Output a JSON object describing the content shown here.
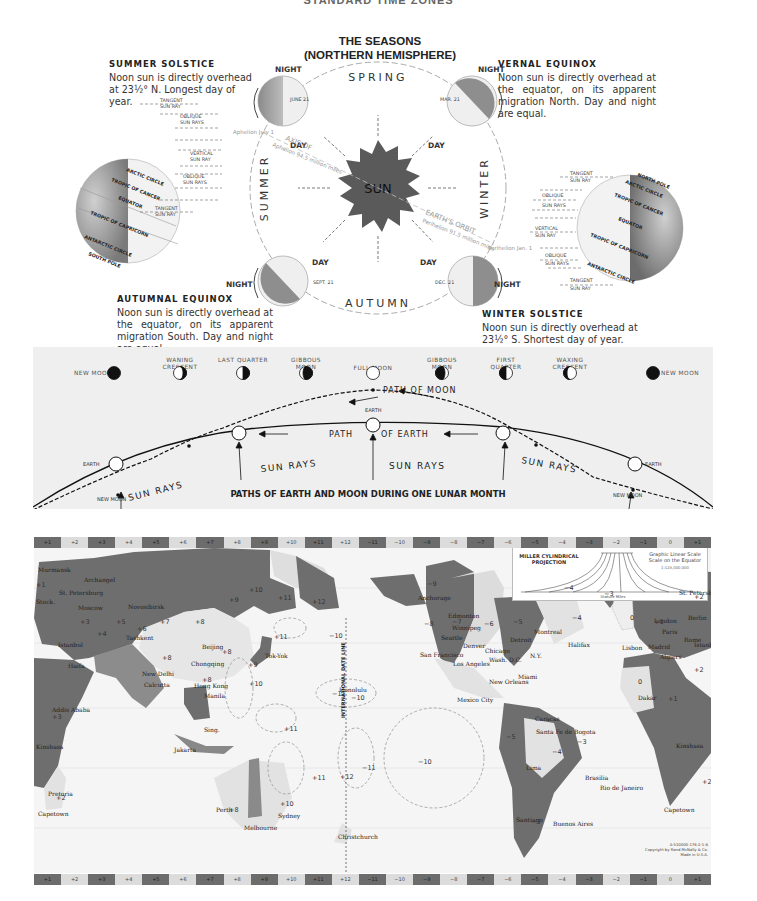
{
  "page": {
    "top_title": "STANDARD TIME ZONES"
  },
  "seasons": {
    "title_line1": "THE SEASONS",
    "title_line2": "(NORTHERN HEMISPHERE)",
    "summer_solstice": {
      "heading": "SUMMER SOLSTICE",
      "body": "Noon sun is directly overhead at 23½° N. Longest day of year."
    },
    "vernal_equinox": {
      "heading": "VERNAL EQUINOX",
      "body": "Noon sun is directly overhead at the equator, on its apparent migration North. Day and night are equal."
    },
    "autumnal_equinox": {
      "heading": "AUTUMNAL EQUINOX",
      "body": "Noon sun is directly overhead at the equator, on its apparent migration South. Day and night are equal."
    },
    "winter_solstice": {
      "heading": "WINTER SOLSTICE",
      "body": "Noon sun is directly overhead at 23½° S. Shortest day of year."
    },
    "season_names": {
      "spring": "SPRING",
      "summer": "SUMMER",
      "autumn": "AUTUMN",
      "winter": "WINTER"
    },
    "sun_label": "SUN",
    "earth_positions": [
      {
        "id": "june",
        "date": "JUNE 21",
        "night": "NIGHT",
        "day": "DAY"
      },
      {
        "id": "march",
        "date": "MAR. 21",
        "night": "NIGHT",
        "day": "DAY"
      },
      {
        "id": "sept",
        "date": "SEPT. 21",
        "night": "NIGHT",
        "day": "DAY"
      },
      {
        "id": "dec",
        "date": "DEC. 21",
        "night": "NIGHT",
        "day": "DAY"
      }
    ],
    "orbit_labels": {
      "aphelion": "Aphelion July 1",
      "axis_of": "AXIS OF",
      "aphelion_distance": "Aphelion 94.5 million miles",
      "earths_orbit": "EARTH'S ORBIT",
      "perihelion_distance": "Perihelion 91.5 million miles",
      "perihelion": "Perihelion Jan. 1",
      "earths_orbit_small": "EARTH'S ORBIT"
    },
    "globe_labels": {
      "left": [
        "ARCTIC CIRCLE",
        "TROPIC OF CANCER",
        "EQUATOR",
        "TROPIC OF CAPRICORN",
        "ANTARCTIC CIRCLE",
        "SOUTH POLE"
      ],
      "right": [
        "NORTH POLE",
        "ARCTIC CIRCLE",
        "TROPIC OF CANCER",
        "EQUATOR",
        "TROPIC OF CAPRICORN",
        "ANTARCTIC CIRCLE"
      ]
    },
    "ray_labels": [
      {
        "line1": "TANGENT",
        "line2": "SUN RAY"
      },
      {
        "line1": "OBLIQUE",
        "line2": "SUN RAYS"
      },
      {
        "line1": "VERTICAL",
        "line2": "SUN RAY"
      },
      {
        "line1": "OBLIQUE",
        "line2": "SUN RAYS"
      },
      {
        "line1": "TANGENT",
        "line2": "SUN RAY"
      }
    ]
  },
  "lunar": {
    "phases": [
      {
        "label": "NEW MOON",
        "type": "new"
      },
      {
        "label": "WANING CRESCENT",
        "type": "waning-crescent"
      },
      {
        "label": "LAST QUARTER",
        "type": "last-quarter"
      },
      {
        "label": "GIBBOUS MOON",
        "type": "gibbous-waning"
      },
      {
        "label": "FULL MOON",
        "type": "full"
      },
      {
        "label": "GIBBOUS MOON",
        "type": "gibbous-waxing"
      },
      {
        "label": "FIRST QUARTER",
        "type": "first-quarter"
      },
      {
        "label": "WAXING CRESCENT",
        "type": "waxing-crescent"
      },
      {
        "label": "NEW MOON",
        "type": "new"
      }
    ],
    "path_of_moon": "PATH OF MOON",
    "path_of_earth_1": "PATH",
    "path_of_earth_2": "OF EARTH",
    "earth_label": "EARTH",
    "new_moon_label": "NEW MOON",
    "sun_rays": "SUN RAYS",
    "caption": "PATHS OF EARTH AND MOON DURING ONE LUNAR MONTH"
  },
  "map": {
    "zone_strip": [
      "+1",
      "+2",
      "+3",
      "+4",
      "+5",
      "+6",
      "+7",
      "+8",
      "+9",
      "+10",
      "+11",
      "+12",
      "−11",
      "−10",
      "−9",
      "−8",
      "−7",
      "−6",
      "−5",
      "−4",
      "−3",
      "−2",
      "−1",
      "0",
      "+1"
    ],
    "zone_dark": [
      true,
      false,
      true,
      false,
      true,
      false,
      true,
      false,
      true,
      false,
      true,
      false,
      true,
      false,
      true,
      false,
      true,
      false,
      true,
      false,
      true,
      false,
      true,
      false,
      true
    ],
    "legend": {
      "projection": "MILLER CYLINDRICAL PROJECTION",
      "scale_title": "Graphic Linear Scale Scale on the Equator",
      "scale_ratio": "1:123,000,000",
      "scale_unit": "Statute Miles"
    },
    "date_line": "INTERNATIONAL DATE LINE",
    "monday_sunday": "MONDAY SUNDAY",
    "cities": [
      {
        "name": "Murmansk",
        "x": 4,
        "y": 18
      },
      {
        "name": "Archangel",
        "x": 50,
        "y": 28
      },
      {
        "name": "St. Petersburg",
        "x": 25,
        "y": 41
      },
      {
        "name": "Stock.",
        "x": 2,
        "y": 50
      },
      {
        "name": "Moscow",
        "x": 44,
        "y": 56
      },
      {
        "name": "Novosibirsk",
        "x": 94,
        "y": 55
      },
      {
        "name": "Tashkent",
        "x": 92,
        "y": 86
      },
      {
        "name": "Istanbul",
        "x": 24,
        "y": 93
      },
      {
        "name": "Beijing",
        "x": 168,
        "y": 95
      },
      {
        "name": "Tok-Yok",
        "x": 231,
        "y": 104
      },
      {
        "name": "Chongqing",
        "x": 157,
        "y": 112
      },
      {
        "name": "New Delhi",
        "x": 108,
        "y": 122
      },
      {
        "name": "Calcutta",
        "x": 110,
        "y": 133
      },
      {
        "name": "Hong Kong",
        "x": 160,
        "y": 134
      },
      {
        "name": "Manila",
        "x": 170,
        "y": 144
      },
      {
        "name": "Haifa",
        "x": 34,
        "y": 114
      },
      {
        "name": "Addis Ababa",
        "x": 18,
        "y": 158
      },
      {
        "name": "Sing.",
        "x": 170,
        "y": 178
      },
      {
        "name": "Jakarta",
        "x": 140,
        "y": 198
      },
      {
        "name": "Kinshasa",
        "x": 2,
        "y": 195
      },
      {
        "name": "Pretoria",
        "x": 14,
        "y": 242
      },
      {
        "name": "Capetown",
        "x": 4,
        "y": 262
      },
      {
        "name": "Perth",
        "x": 182,
        "y": 258
      },
      {
        "name": "Sydney",
        "x": 244,
        "y": 264
      },
      {
        "name": "Melbourne",
        "x": 210,
        "y": 276
      },
      {
        "name": "Christchurch",
        "x": 304,
        "y": 285
      },
      {
        "name": "Honolulu",
        "x": 305,
        "y": 138
      },
      {
        "name": "Anchorage",
        "x": 384,
        "y": 46
      },
      {
        "name": "Edmonton",
        "x": 414,
        "y": 64
      },
      {
        "name": "Winnipeg",
        "x": 418,
        "y": 76
      },
      {
        "name": "Seattle",
        "x": 407,
        "y": 86
      },
      {
        "name": "Denver",
        "x": 429,
        "y": 94
      },
      {
        "name": "San Francisco",
        "x": 386,
        "y": 103
      },
      {
        "name": "Los Angeles",
        "x": 419,
        "y": 112
      },
      {
        "name": "Chicago",
        "x": 451,
        "y": 99
      },
      {
        "name": "Detroit",
        "x": 476,
        "y": 88
      },
      {
        "name": "Montreal",
        "x": 500,
        "y": 80
      },
      {
        "name": "Halifax",
        "x": 534,
        "y": 93
      },
      {
        "name": "N.Y.",
        "x": 496,
        "y": 104
      },
      {
        "name": "Wash. D.C.",
        "x": 455,
        "y": 108
      },
      {
        "name": "Miami",
        "x": 484,
        "y": 125
      },
      {
        "name": "New Orleans",
        "x": 455,
        "y": 130
      },
      {
        "name": "Mexico City",
        "x": 423,
        "y": 148
      },
      {
        "name": "Caracas",
        "x": 501,
        "y": 167
      },
      {
        "name": "Santa Fe de Bogota",
        "x": 502,
        "y": 180
      },
      {
        "name": "Lima",
        "x": 492,
        "y": 216
      },
      {
        "name": "Brasilia",
        "x": 551,
        "y": 226
      },
      {
        "name": "Rio de Janeiro",
        "x": 566,
        "y": 236
      },
      {
        "name": "Santiago",
        "x": 482,
        "y": 268
      },
      {
        "name": "Buenos Aires",
        "x": 519,
        "y": 272
      },
      {
        "name": "St. Petersburg",
        "x": 645,
        "y": 41
      },
      {
        "name": "London",
        "x": 620,
        "y": 69
      },
      {
        "name": "Berlin",
        "x": 654,
        "y": 66
      },
      {
        "name": "Paris",
        "x": 628,
        "y": 80
      },
      {
        "name": "Rome",
        "x": 650,
        "y": 88
      },
      {
        "name": "Istanbul",
        "x": 660,
        "y": 93
      },
      {
        "name": "Lisbon",
        "x": 588,
        "y": 96
      },
      {
        "name": "Madrid",
        "x": 614,
        "y": 95
      },
      {
        "name": "Algiers",
        "x": 626,
        "y": 105
      },
      {
        "name": "Dakar",
        "x": 604,
        "y": 146
      },
      {
        "name": "Kinshasa",
        "x": 642,
        "y": 194
      },
      {
        "name": "Capetown",
        "x": 630,
        "y": 258
      }
    ],
    "zone_numbers": [
      {
        "v": "+1",
        "x": 2,
        "y": 33
      },
      {
        "v": "+3",
        "x": 46,
        "y": 70
      },
      {
        "v": "+5",
        "x": 82,
        "y": 70
      },
      {
        "v": "+4",
        "x": 63,
        "y": 82
      },
      {
        "v": "+6",
        "x": 103,
        "y": 77
      },
      {
        "v": "+7",
        "x": 126,
        "y": 70
      },
      {
        "v": "+8",
        "x": 161,
        "y": 70
      },
      {
        "v": "+9",
        "x": 195,
        "y": 48
      },
      {
        "v": "+10",
        "x": 215,
        "y": 38
      },
      {
        "v": "+11",
        "x": 244,
        "y": 46
      },
      {
        "v": "+12",
        "x": 278,
        "y": 50
      },
      {
        "v": "+11",
        "x": 240,
        "y": 85
      },
      {
        "v": "−10",
        "x": 295,
        "y": 84
      },
      {
        "v": "+8",
        "x": 128,
        "y": 106
      },
      {
        "v": "+8",
        "x": 188,
        "y": 100
      },
      {
        "v": "+9",
        "x": 214,
        "y": 113
      },
      {
        "v": "+8",
        "x": 168,
        "y": 128
      },
      {
        "v": "+10",
        "x": 215,
        "y": 132
      },
      {
        "v": "+11",
        "x": 250,
        "y": 177
      },
      {
        "v": "−11",
        "x": 298,
        "y": 142
      },
      {
        "v": "−10",
        "x": 317,
        "y": 146
      },
      {
        "v": "+12",
        "x": 306,
        "y": 225
      },
      {
        "v": "−11",
        "x": 328,
        "y": 216
      },
      {
        "v": "−10",
        "x": 384,
        "y": 210
      },
      {
        "v": "+11",
        "x": 278,
        "y": 226
      },
      {
        "v": "+8",
        "x": 195,
        "y": 258
      },
      {
        "v": "+10",
        "x": 246,
        "y": 252
      },
      {
        "v": "−9",
        "x": 393,
        "y": 32
      },
      {
        "v": "−8",
        "x": 390,
        "y": 72
      },
      {
        "v": "−7",
        "x": 418,
        "y": 70
      },
      {
        "v": "−6",
        "x": 450,
        "y": 72
      },
      {
        "v": "−5",
        "x": 479,
        "y": 70
      },
      {
        "v": "−4",
        "x": 538,
        "y": 66
      },
      {
        "v": "−3",
        "x": 570,
        "y": 42
      },
      {
        "v": "−4",
        "x": 530,
        "y": 36
      },
      {
        "v": "−5",
        "x": 472,
        "y": 185
      },
      {
        "v": "−4",
        "x": 518,
        "y": 200
      },
      {
        "v": "−3",
        "x": 543,
        "y": 190
      },
      {
        "v": "−3",
        "x": 497,
        "y": 270
      },
      {
        "v": "0",
        "x": 596,
        "y": 66
      },
      {
        "v": "0",
        "x": 604,
        "y": 130
      },
      {
        "v": "+1",
        "x": 634,
        "y": 147
      },
      {
        "v": "+1",
        "x": 620,
        "y": 70
      },
      {
        "v": "+2",
        "x": 660,
        "y": 45
      },
      {
        "v": "+2",
        "x": 660,
        "y": 118
      },
      {
        "v": "+2",
        "x": 668,
        "y": 230
      },
      {
        "v": "+3",
        "x": 18,
        "y": 165
      },
      {
        "v": "+2",
        "x": 22,
        "y": 246
      }
    ],
    "credit_line1": "A-510000-176-2-1-8",
    "credit_line2": "Copyright by Rand McNally & Co.",
    "credit_line3": "Made in U.S.A."
  }
}
